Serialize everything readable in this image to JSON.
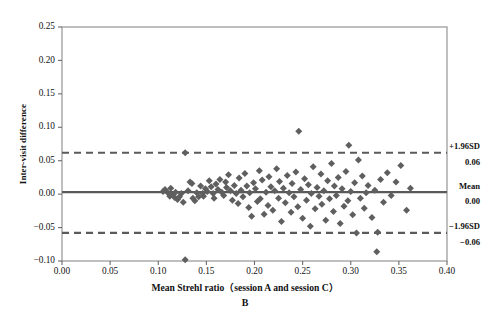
{
  "chart_data": {
    "type": "scatter",
    "title": "",
    "panel_letter": "B",
    "xlabel": "Mean Strehl ratio（session A and session C）",
    "ylabel": "Inter-visit difference",
    "xlim": [
      0.0,
      0.4
    ],
    "ylim": [
      -0.1,
      0.25
    ],
    "xticks": [
      "0.00",
      "0.05",
      "0.10",
      "0.15",
      "0.20",
      "0.25",
      "0.30",
      "0.35",
      "0.40"
    ],
    "xtick_values": [
      0.0,
      0.05,
      0.1,
      0.15,
      0.2,
      0.25,
      0.3,
      0.35,
      0.4
    ],
    "yticks": [
      "0.25",
      "0.20",
      "0.15",
      "0.10",
      "0.05",
      "0.00",
      "-0.05",
      "-0.10"
    ],
    "ytick_values": [
      0.25,
      0.2,
      0.15,
      0.1,
      0.05,
      0.0,
      -0.05,
      -0.1
    ],
    "grid": false,
    "legend": "none",
    "marker": "diamond",
    "marker_color": "#5f5f5f",
    "reference_lines": [
      {
        "name": "upper-limit-of-agreement",
        "label": "+1.96SD",
        "value_label": "0.06",
        "value": 0.062,
        "style": "dashed",
        "color": "#5a5a5a"
      },
      {
        "name": "mean-difference",
        "label": "Mean",
        "value_label": "0.00",
        "value": 0.003,
        "style": "solid",
        "color": "#5a5a5a"
      },
      {
        "name": "lower-limit-of-agreement",
        "label": "-1.96SD",
        "value_label": "-0.06",
        "value": -0.058,
        "style": "dashed",
        "color": "#5a5a5a"
      }
    ],
    "points": [
      [
        0.105,
        0.004
      ],
      [
        0.107,
        0.007
      ],
      [
        0.11,
        0.002
      ],
      [
        0.112,
        -0.003
      ],
      [
        0.113,
        0.009
      ],
      [
        0.115,
        -0.001
      ],
      [
        0.117,
        -0.005
      ],
      [
        0.118,
        0.003
      ],
      [
        0.12,
        -0.008
      ],
      [
        0.122,
        -0.004
      ],
      [
        0.124,
        0.001
      ],
      [
        0.126,
        -0.012
      ],
      [
        0.128,
        0.062
      ],
      [
        0.128,
        -0.098
      ],
      [
        0.131,
        0.005
      ],
      [
        0.133,
        0.018
      ],
      [
        0.135,
        0.016
      ],
      [
        0.136,
        -0.006
      ],
      [
        0.138,
        -0.01
      ],
      [
        0.14,
        0.002
      ],
      [
        0.142,
        -0.004
      ],
      [
        0.144,
        0.012
      ],
      [
        0.146,
        0.001
      ],
      [
        0.147,
        -0.003
      ],
      [
        0.149,
        0.008
      ],
      [
        0.151,
        0.004
      ],
      [
        0.153,
        0.02
      ],
      [
        0.155,
        0.011
      ],
      [
        0.157,
        0.001
      ],
      [
        0.158,
        -0.006
      ],
      [
        0.16,
        0.015
      ],
      [
        0.162,
        0.007
      ],
      [
        0.164,
        0.022
      ],
      [
        0.166,
        0.003
      ],
      [
        0.168,
        -0.002
      ],
      [
        0.17,
        0.018
      ],
      [
        0.171,
        0.01
      ],
      [
        0.173,
        0.029
      ],
      [
        0.175,
        0.005
      ],
      [
        0.177,
        -0.009
      ],
      [
        0.179,
        0.013
      ],
      [
        0.181,
        0.001
      ],
      [
        0.183,
        -0.014
      ],
      [
        0.184,
        0.024
      ],
      [
        0.186,
        0.006
      ],
      [
        0.188,
        -0.004
      ],
      [
        0.19,
        0.031
      ],
      [
        0.192,
        0.012
      ],
      [
        0.194,
        -0.02
      ],
      [
        0.195,
        0.002
      ],
      [
        0.197,
        -0.033
      ],
      [
        0.199,
        0.017
      ],
      [
        0.201,
        0.008
      ],
      [
        0.203,
        -0.011
      ],
      [
        0.205,
        0.035
      ],
      [
        0.206,
        -0.007
      ],
      [
        0.208,
        0.021
      ],
      [
        0.21,
        -0.03
      ],
      [
        0.212,
        0.003
      ],
      [
        0.214,
        -0.017
      ],
      [
        0.215,
        0.026
      ],
      [
        0.217,
        0.011
      ],
      [
        0.219,
        -0.024
      ],
      [
        0.221,
        0.005
      ],
      [
        0.223,
        0.038
      ],
      [
        0.225,
        -0.006
      ],
      [
        0.226,
        0.019
      ],
      [
        0.228,
        -0.041
      ],
      [
        0.23,
        0.009
      ],
      [
        0.232,
        -0.013
      ],
      [
        0.234,
        0.028
      ],
      [
        0.236,
        0.002
      ],
      [
        0.238,
        -0.027
      ],
      [
        0.239,
        0.016
      ],
      [
        0.241,
        -0.004
      ],
      [
        0.243,
        0.033
      ],
      [
        0.245,
        -0.019
      ],
      [
        0.246,
        0.094
      ],
      [
        0.248,
        0.007
      ],
      [
        0.25,
        -0.036
      ],
      [
        0.252,
        0.023
      ],
      [
        0.254,
        -0.009
      ],
      [
        0.256,
        0.014
      ],
      [
        0.258,
        -0.048
      ],
      [
        0.259,
        0.001
      ],
      [
        0.261,
        0.041
      ],
      [
        0.263,
        -0.022
      ],
      [
        0.265,
        0.01
      ],
      [
        0.267,
        -0.003
      ],
      [
        0.269,
        0.03
      ],
      [
        0.27,
        -0.015
      ],
      [
        0.272,
        0.005
      ],
      [
        0.274,
        -0.039
      ],
      [
        0.276,
        0.02
      ],
      [
        0.278,
        -0.007
      ],
      [
        0.28,
        0.046
      ],
      [
        0.282,
        -0.026
      ],
      [
        0.283,
        0.012
      ],
      [
        0.285,
        -0.002
      ],
      [
        0.287,
        0.025
      ],
      [
        0.289,
        -0.044
      ],
      [
        0.291,
        0.008
      ],
      [
        0.293,
        -0.018
      ],
      [
        0.295,
        0.034
      ],
      [
        0.297,
        -0.01
      ],
      [
        0.298,
        0.073
      ],
      [
        0.3,
        0.004
      ],
      [
        0.302,
        -0.031
      ],
      [
        0.304,
        0.017
      ],
      [
        0.306,
        -0.058
      ],
      [
        0.308,
        0.051
      ],
      [
        0.31,
        -0.006
      ],
      [
        0.312,
        0.027
      ],
      [
        0.314,
        -0.021
      ],
      [
        0.316,
        0.002
      ],
      [
        0.318,
        0.013
      ],
      [
        0.322,
        -0.035
      ],
      [
        0.325,
        0.006
      ],
      [
        0.327,
        -0.086
      ],
      [
        0.328,
        -0.057
      ],
      [
        0.331,
        0.022
      ],
      [
        0.334,
        -0.012
      ],
      [
        0.338,
        0.032
      ],
      [
        0.342,
        -0.002
      ],
      [
        0.347,
        0.018
      ],
      [
        0.352,
        0.043
      ],
      [
        0.358,
        -0.024
      ],
      [
        0.362,
        0.009
      ]
    ]
  }
}
